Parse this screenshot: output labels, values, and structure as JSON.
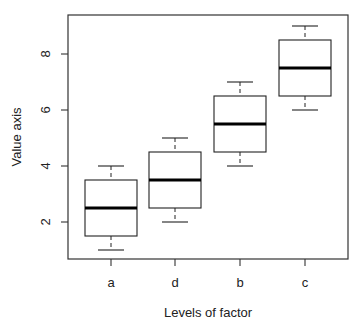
{
  "chart_data": {
    "type": "boxplot",
    "title": "",
    "xlabel": "Levels of factor",
    "ylabel": "Value axis",
    "categories": [
      "a",
      "d",
      "b",
      "c"
    ],
    "boxes": [
      {
        "category": "a",
        "min": 1.0,
        "q1": 1.5,
        "median": 2.5,
        "q3": 3.5,
        "max": 4.0
      },
      {
        "category": "d",
        "min": 2.0,
        "q1": 2.5,
        "median": 3.5,
        "q3": 4.5,
        "max": 5.0
      },
      {
        "category": "b",
        "min": 4.0,
        "q1": 4.5,
        "median": 5.5,
        "q3": 6.5,
        "max": 7.0
      },
      {
        "category": "c",
        "min": 6.0,
        "q1": 6.5,
        "median": 7.5,
        "q3": 8.5,
        "max": 9.0
      }
    ],
    "y_ticks": [
      2,
      4,
      6,
      8
    ],
    "ylim": [
      0.64,
      9.36
    ],
    "grid": false,
    "legend": null
  },
  "colors": {
    "axis": "#333333",
    "box_stroke": "#222222",
    "median": "#000000",
    "box_fill": "#ffffff"
  }
}
